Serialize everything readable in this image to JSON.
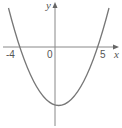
{
  "diagram": {
    "type": "parabola-graph",
    "equation_form": "y = (x + 4)(x - 5)",
    "axes": {
      "x_label": "x",
      "y_label": "y",
      "origin_label": "0"
    },
    "x_intercepts": [
      {
        "value": -4,
        "label": "-4"
      },
      {
        "value": 5,
        "label": "5"
      }
    ],
    "colors": {
      "curve": "#777777",
      "axes": "#888888",
      "text": "#555555",
      "background": "#ffffff"
    }
  }
}
